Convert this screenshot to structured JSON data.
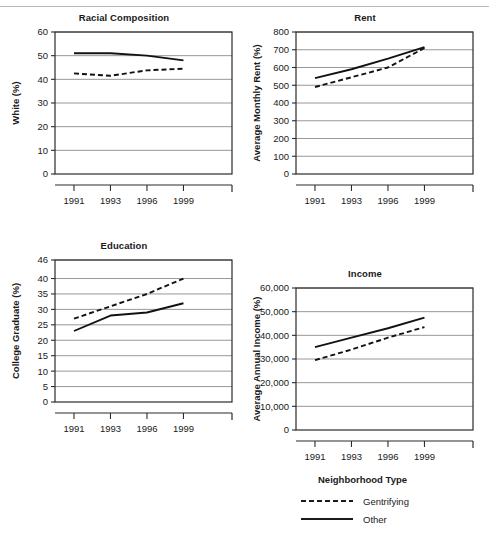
{
  "figure": {
    "legend": {
      "title": "Neighborhood Type",
      "entries": [
        {
          "label": "Gentrifying",
          "style": "dashed"
        },
        {
          "label": "Other",
          "style": "solid"
        }
      ]
    }
  },
  "chart_data": [
    {
      "id": "racial",
      "type": "line",
      "title": "Racial Composition",
      "xlabel": "",
      "ylabel": "White (%)",
      "categories": [
        "1991",
        "1993",
        "1996",
        "1999"
      ],
      "x": [
        "1991",
        "1993",
        "1996",
        "1999"
      ],
      "ylim": [
        0,
        60
      ],
      "yticks": [
        0,
        10,
        20,
        30,
        40,
        50,
        60
      ],
      "ytick_labels": [
        "0",
        "10",
        "20",
        "30",
        "40",
        "50",
        "60"
      ],
      "grid": true,
      "legend_position": "figure-bottom-right",
      "series": [
        {
          "name": "Gentrifying",
          "style": "dashed",
          "values": [
            42.5,
            41.5,
            43.8,
            44.5
          ]
        },
        {
          "name": "Other",
          "style": "solid",
          "values": [
            51.0,
            51.0,
            50.0,
            48.0
          ]
        }
      ]
    },
    {
      "id": "rent",
      "type": "line",
      "title": "Rent",
      "xlabel": "",
      "ylabel": "Average Monthly Rent (%)",
      "categories": [
        "1991",
        "1993",
        "1996",
        "1999"
      ],
      "x": [
        "1991",
        "1993",
        "1996",
        "1999"
      ],
      "ylim": [
        0,
        800
      ],
      "yticks": [
        0,
        100,
        200,
        300,
        400,
        500,
        600,
        700,
        800
      ],
      "ytick_labels": [
        "0",
        "100",
        "200",
        "300",
        "400",
        "500",
        "600",
        "700",
        "800"
      ],
      "grid": true,
      "legend_position": "figure-bottom-right",
      "series": [
        {
          "name": "Gentrifying",
          "style": "dashed",
          "values": [
            490,
            545,
            600,
            710
          ]
        },
        {
          "name": "Other",
          "style": "solid",
          "values": [
            540,
            590,
            650,
            715
          ]
        }
      ]
    },
    {
      "id": "education",
      "type": "line",
      "title": "Education",
      "xlabel": "",
      "ylabel": "College Graduate (%)",
      "categories": [
        "1991",
        "1993",
        "1996",
        "1999"
      ],
      "x": [
        "1991",
        "1993",
        "1996",
        "1999"
      ],
      "ylim": [
        0,
        46
      ],
      "yticks": [
        0,
        5,
        10,
        15,
        20,
        25,
        30,
        35,
        40,
        46
      ],
      "ytick_labels": [
        "0",
        "5",
        "10",
        "15",
        "20",
        "25",
        "30",
        "35",
        "40",
        "46"
      ],
      "grid": true,
      "legend_position": "figure-bottom-right",
      "series": [
        {
          "name": "Gentrifying",
          "style": "dashed",
          "values": [
            27,
            31,
            35,
            40
          ]
        },
        {
          "name": "Other",
          "style": "solid",
          "values": [
            23,
            28,
            29,
            32
          ]
        }
      ]
    },
    {
      "id": "income",
      "type": "line",
      "title": "Income",
      "xlabel": "",
      "ylabel": "Average Annual Income (%)",
      "categories": [
        "1991",
        "1993",
        "1996",
        "1999"
      ],
      "x": [
        "1991",
        "1993",
        "1996",
        "1999"
      ],
      "ylim": [
        0,
        60000
      ],
      "yticks": [
        0,
        10000,
        20000,
        30000,
        40000,
        50000,
        60000
      ],
      "ytick_labels": [
        "0",
        "10,000",
        "20,000",
        "30,000",
        "40,000",
        "50,000",
        "60,000"
      ],
      "grid": true,
      "legend_position": "figure-bottom-right",
      "series": [
        {
          "name": "Gentrifying",
          "style": "dashed",
          "values": [
            29500,
            34000,
            39000,
            43500
          ]
        },
        {
          "name": "Other",
          "style": "solid",
          "values": [
            35000,
            39000,
            43000,
            47500
          ]
        }
      ]
    }
  ]
}
